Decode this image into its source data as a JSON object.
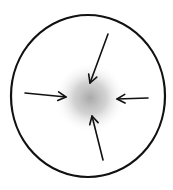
{
  "diagram": {
    "type": "convergence",
    "colors": {
      "background": "#ffffff",
      "stroke": "#111111",
      "center_glow": "#9a9a9a"
    },
    "boundary": {
      "shape": "ellipse",
      "cx": 88,
      "cy": 96,
      "rx": 77,
      "ry": 81
    },
    "center": {
      "cx": 90,
      "cy": 98,
      "r": 36
    },
    "arrows": [
      {
        "id": "top",
        "x1": 108,
        "y1": 34,
        "x2": 90,
        "y2": 83
      },
      {
        "id": "left",
        "x1": 25,
        "y1": 93,
        "x2": 66,
        "y2": 97
      },
      {
        "id": "right",
        "x1": 148,
        "y1": 98,
        "x2": 117,
        "y2": 99
      },
      {
        "id": "bottom",
        "x1": 103,
        "y1": 160,
        "x2": 92,
        "y2": 116
      }
    ]
  }
}
